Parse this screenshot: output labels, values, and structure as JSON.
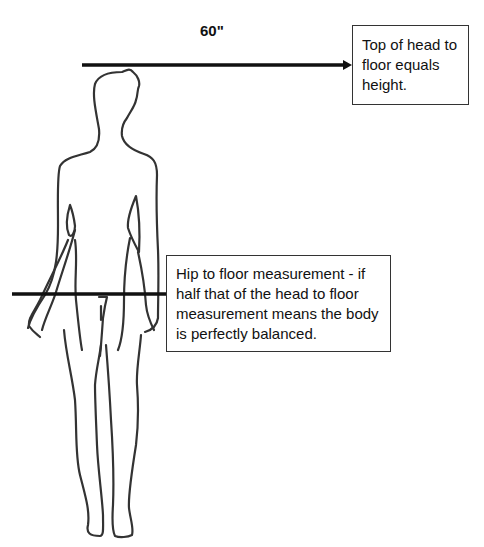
{
  "diagram": {
    "clipped_header_text": "",
    "height_label": "60\"",
    "callouts": {
      "top": "Top of head to floor equals height.",
      "hip": "Hip to floor measurement - if half that of the head to floor measurement means the body is perfectly balanced."
    },
    "lines": {
      "height_arrow": {
        "x1": 82,
        "y": 65,
        "x2": 351,
        "direction": "right"
      },
      "hip_line": {
        "x1": 12,
        "y": 294,
        "x2": 166
      }
    },
    "colors": {
      "line": "#111111",
      "outline": "#333333",
      "background": "#ffffff"
    }
  }
}
